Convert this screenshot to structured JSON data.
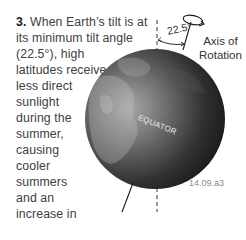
{
  "caption": {
    "number": "3.",
    "lines": [
      " When Earth’s tilt is at",
      "its minimum tilt angle",
      "(22.5°), high",
      "latitudes receive",
      "less direct",
      "sunlight",
      "during the",
      "summer,",
      "causing",
      "cooler",
      "summers",
      "and an",
      "increase in",
      "glaciers."
    ]
  },
  "diagram": {
    "angle_label": "22.5°",
    "axis_label_line1": "Axis of",
    "axis_label_line2": "Rotation",
    "equator_label": "EQUATOR",
    "figure_id": "14.09.a3",
    "icons": {
      "globe": "earth-globe",
      "rotation": "rotation-ellipse-arrow"
    },
    "colors": {
      "globe_dark": "#1c1c1c",
      "globe_light": "#9a9a9a",
      "text": "#404040"
    }
  }
}
